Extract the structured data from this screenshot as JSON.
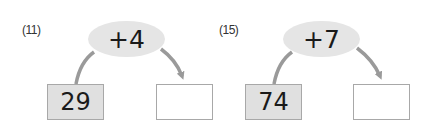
{
  "problems": [
    {
      "number_label": "(11)",
      "operation": "+4",
      "start_value": "29",
      "answer_value": ""
    },
    {
      "number_label": "(15)",
      "operation": "+7",
      "start_value": "74",
      "answer_value": ""
    }
  ],
  "colors": {
    "bubble_fill": "#e5e5e5",
    "start_box_fill": "#e0e0e0",
    "box_border": "#a8a8a8",
    "arrow": "#9a9a9a"
  }
}
